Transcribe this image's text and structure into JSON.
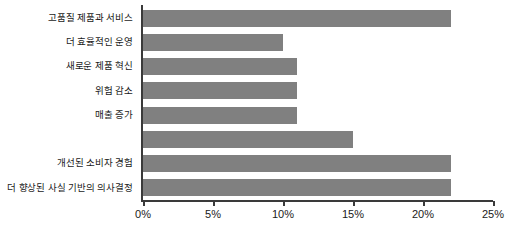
{
  "chart_data": {
    "type": "bar",
    "orientation": "horizontal",
    "title": "",
    "xlabel": "",
    "ylabel": "",
    "xlim": [
      0,
      25
    ],
    "grid": false,
    "legend": null,
    "bar_color": "#808080",
    "axis_color": "#3a3a3a",
    "value_unit": "%",
    "xticks": [
      0,
      5,
      10,
      15,
      20,
      25
    ],
    "xtick_labels": [
      "0%",
      "5%",
      "10%",
      "15%",
      "20%",
      "25%"
    ],
    "categories": [
      "고품질 제품과 서비스",
      "더 효율적인 운영",
      "새로운 제품 혁신",
      "위험 감소",
      "매출 증가",
      "",
      "개선된 소비자 경험",
      "더 향상된 사실 기반의 의사결정"
    ],
    "values": [
      22,
      10,
      11,
      11,
      11,
      15,
      22,
      22
    ]
  }
}
